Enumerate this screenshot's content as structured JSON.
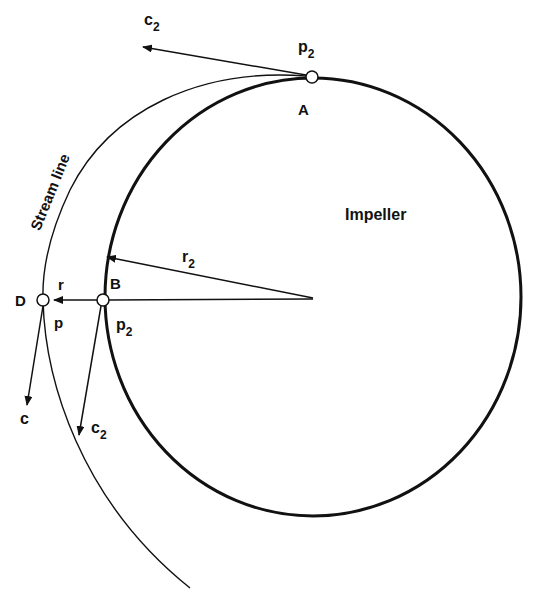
{
  "diagram": {
    "type": "impeller-streamline",
    "colors": {
      "stroke": "#111111",
      "background": "#ffffff"
    },
    "labels": {
      "impeller": "Impeller",
      "stream_line": "Stream line",
      "point_a": "A",
      "point_b": "B",
      "point_d": "D",
      "pressure_top": {
        "base": "p",
        "sub": "2"
      },
      "pressure_b": {
        "base": "p",
        "sub": "2"
      },
      "pressure_d": "p",
      "velocity_top": {
        "base": "c",
        "sub": "2"
      },
      "velocity_b": {
        "base": "c",
        "sub": "2"
      },
      "velocity_d": "c",
      "radius_impeller": {
        "base": "r",
        "sub": "2"
      },
      "radius_d": "r"
    },
    "nodes": [
      {
        "id": "A",
        "x": 312,
        "y": 77
      },
      {
        "id": "B",
        "x": 103,
        "y": 300
      },
      {
        "id": "D",
        "x": 43,
        "y": 300
      }
    ],
    "impeller_circle": {
      "cx": 313,
      "cy": 297,
      "rx": 208,
      "ry": 219
    }
  }
}
